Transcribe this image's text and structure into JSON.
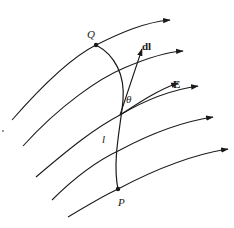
{
  "diagram": {
    "labels": {
      "Q": "Q",
      "P": "P",
      "dl": "dl",
      "E": "E",
      "theta": "θ",
      "l": "l"
    },
    "field_lines": [
      {
        "id": "line-1",
        "from": [
          12,
          120
        ],
        "to": [
          170,
          20
        ]
      },
      {
        "id": "line-2",
        "from": [
          23,
          146
        ],
        "to": [
          183,
          51
        ]
      },
      {
        "id": "line-3",
        "from": [
          36,
          177
        ],
        "to": [
          198,
          86
        ]
      },
      {
        "id": "line-4",
        "from": [
          52,
          200
        ],
        "to": [
          213,
          117
        ]
      },
      {
        "id": "line-5",
        "from": [
          68,
          217
        ],
        "to": [
          228,
          149
        ]
      }
    ],
    "points": {
      "Q": [
        96,
        45
      ],
      "P": [
        118,
        189
      ],
      "intersection": [
        120,
        115
      ]
    },
    "colors": {
      "stroke": "#1a1a1a",
      "background": "#ffffff"
    }
  }
}
